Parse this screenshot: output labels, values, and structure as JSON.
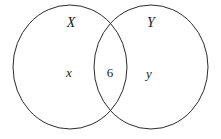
{
  "diagram": {
    "type": "venn",
    "title": "",
    "background_color": "#ffffff",
    "stroke_color": "#2b2b2b",
    "stroke_width": 1,
    "sets": [
      {
        "id": "X",
        "name_label": "X",
        "shape": "ellipse",
        "center_x": 70,
        "center_y": 67,
        "radius_x": 57,
        "radius_y": 62
      },
      {
        "id": "Y",
        "name_label": "Y",
        "shape": "ellipse",
        "center_x": 151,
        "center_y": 67,
        "radius_x": 57,
        "radius_y": 62
      }
    ],
    "regions": [
      {
        "id": "x-only",
        "label": "x",
        "description": "elements only in X"
      },
      {
        "id": "intersection",
        "label": "6",
        "description": "elements in both X and Y"
      },
      {
        "id": "y-only",
        "label": "y",
        "description": "elements only in Y"
      }
    ]
  }
}
